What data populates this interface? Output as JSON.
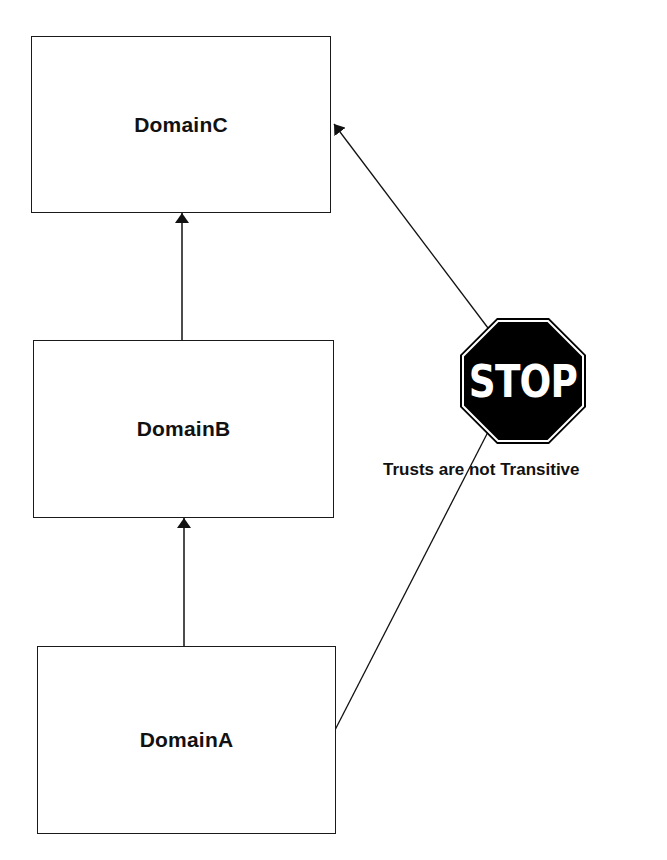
{
  "diagram": {
    "nodes": [
      {
        "id": "C",
        "label": "DomainC"
      },
      {
        "id": "B",
        "label": "DomainB"
      },
      {
        "id": "A",
        "label": "DomainA"
      }
    ],
    "edges": [
      {
        "from": "B",
        "to": "C",
        "type": "arrow"
      },
      {
        "from": "A",
        "to": "B",
        "type": "arrow"
      },
      {
        "from": "A",
        "to": "C",
        "type": "arrow",
        "blocked": true
      }
    ],
    "stop_sign": {
      "text": "STOP",
      "color": "#000000",
      "text_color": "#ffffff"
    },
    "caption": "Trusts are not Transitive"
  }
}
